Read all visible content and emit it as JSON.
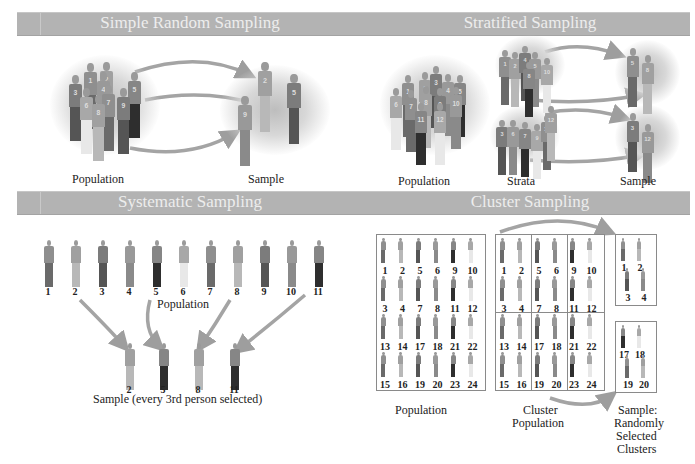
{
  "colors": {
    "header_bar": "#b3b3b3",
    "header_text": "#ededed",
    "arrow": "#9e9e9e",
    "halo": "#c4c4c4"
  },
  "panels": {
    "simple_random": {
      "title": "Simple Random Sampling",
      "population_label": "Population",
      "sample_label": "Sample",
      "population_ids": [
        "1",
        "2",
        "3",
        "4",
        "5",
        "6",
        "7",
        "8",
        "9"
      ],
      "sample_ids": [
        "2",
        "5",
        "9"
      ]
    },
    "stratified": {
      "title": "Stratified Sampling",
      "population_label": "Population",
      "strata_label": "Strata",
      "sample_label": "Sample",
      "population_ids": [
        "1",
        "2",
        "3",
        "4",
        "5",
        "6",
        "7",
        "8",
        "9",
        "10",
        "11",
        "12"
      ],
      "strata": [
        {
          "ids": [
            "1",
            "2",
            "4",
            "5",
            "8",
            "10"
          ]
        },
        {
          "ids": [
            "3",
            "6",
            "7",
            "9",
            "11",
            "12"
          ]
        }
      ],
      "sample_ids": [
        [
          "5",
          "8"
        ],
        [
          "3",
          "12"
        ]
      ]
    },
    "systematic": {
      "title": "Systematic Sampling",
      "population_label": "Population",
      "population_ids": [
        "1",
        "2",
        "3",
        "4",
        "5",
        "6",
        "7",
        "8",
        "9",
        "10",
        "11"
      ],
      "sample_ids": [
        "2",
        "5",
        "8",
        "11"
      ],
      "sample_label": "Sample (every 3rd person selected)"
    },
    "cluster": {
      "title": "Cluster Sampling",
      "population_label": "Population",
      "cluster_population_label_line1": "Cluster",
      "cluster_population_label_line2": "Population",
      "sample_label_line1": "Sample:",
      "sample_label_line2": "Randomly",
      "sample_label_line3": "Selected",
      "sample_label_line4": "Clusters",
      "grid_rows": [
        [
          "1",
          "2",
          "5",
          "6",
          "9",
          "10"
        ],
        [
          "3",
          "4",
          "7",
          "8",
          "11",
          "12"
        ],
        [
          "13",
          "14",
          "17",
          "18",
          "21",
          "22"
        ],
        [
          "15",
          "16",
          "19",
          "20",
          "23",
          "24"
        ]
      ],
      "selected_clusters": [
        {
          "ids": [
            "1",
            "2",
            "3",
            "4"
          ]
        },
        {
          "ids": [
            "17",
            "18",
            "19",
            "20"
          ]
        }
      ]
    }
  }
}
